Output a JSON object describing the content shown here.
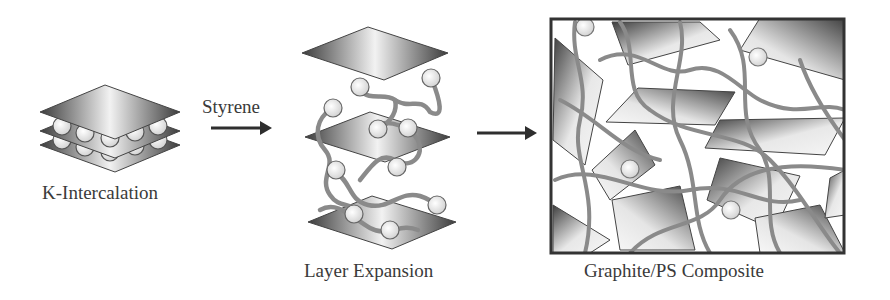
{
  "diagram": {
    "stages": [
      {
        "id": "k-intercalation",
        "label": "K-Intercalation"
      },
      {
        "id": "layer-expansion",
        "label": "Layer Expansion"
      },
      {
        "id": "composite",
        "label": "Graphite/PS Composite"
      }
    ],
    "arrows": [
      {
        "from": "k-intercalation",
        "to": "layer-expansion",
        "label": "Styrene"
      },
      {
        "from": "layer-expansion",
        "to": "composite",
        "label": ""
      }
    ],
    "colors": {
      "sheet_dark": "#3c3c3c",
      "sheet_light": "#f2f2f2",
      "polymer_chain": "#8a8a8a",
      "sphere_fill": "#eeeeee",
      "frame": "#333333",
      "arrow": "#2e2e2e",
      "text": "#3a3a3a"
    }
  }
}
